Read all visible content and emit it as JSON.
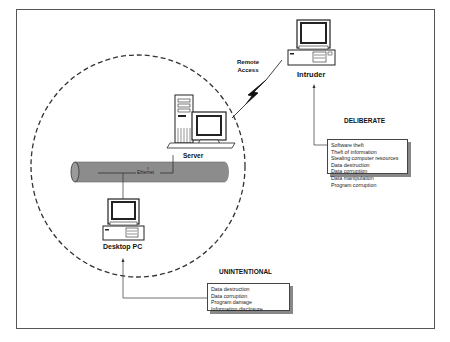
{
  "diagram": {
    "nodes": {
      "intruder": {
        "label": "Intruder",
        "icon": "desktop-computer-icon"
      },
      "server": {
        "label": "Server",
        "icon": "tower-server-icon"
      },
      "desktop_pc": {
        "label": "Desktop PC",
        "icon": "desktop-computer-icon"
      }
    },
    "network": {
      "label": "Ethernet",
      "icon": "network-pipe"
    },
    "connection": {
      "label_line1": "Remote",
      "label_line2": "Access",
      "icon": "lightning-bolt-icon"
    },
    "categories": {
      "deliberate": {
        "title": "DELIBERATE",
        "items": [
          "Software  theft",
          "Theft of information",
          "Stealing computer resources",
          "Data destruction",
          "Data corruption",
          "Data manipulation",
          "Program corruption"
        ]
      },
      "unintentional": {
        "title": "UNINTENTIONAL",
        "items": [
          "Data destruction",
          "Data corruption",
          "Program damage",
          "Information  disclosure"
        ]
      }
    },
    "colors": {
      "line": "#333333",
      "pipe_fill": "#8c8c8c",
      "shadow": "#888888",
      "frame": "#555555"
    }
  }
}
